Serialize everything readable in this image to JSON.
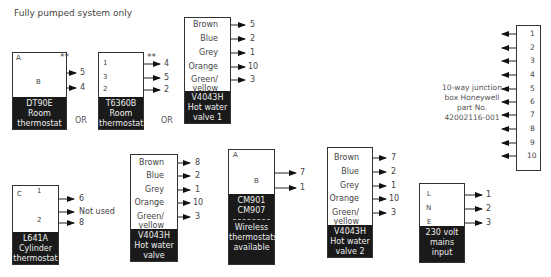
{
  "title": "Fully pumped system only",
  "or_label": "OR",
  "double_star": "**",
  "dt90e": {
    "label": [
      "DT90E",
      "Room",
      "thermostat"
    ],
    "terminals": [
      "A",
      "B"
    ],
    "outputs": [
      "5",
      "4"
    ]
  },
  "t6360b": {
    "label": [
      "T6360B",
      "Room",
      "thermostat"
    ],
    "terminals": [
      "1",
      "3",
      "2"
    ],
    "outputs": [
      "4",
      "5",
      "2"
    ]
  },
  "valve1": {
    "label": [
      "V4043H",
      "Hot water",
      "valve 1"
    ],
    "wires": [
      {
        "color": "Brown",
        "to": "5"
      },
      {
        "color": "Blue",
        "to": "2"
      },
      {
        "color": "Grey",
        "to": "1"
      },
      {
        "color": "Orange",
        "to": "10"
      },
      {
        "color": "Green/",
        "color2": "yellow",
        "to": "3"
      }
    ]
  },
  "junction": {
    "description": [
      "10-way junction",
      "box Honeywell",
      "part No.",
      "42002116-001"
    ],
    "terminals": [
      "1",
      "2",
      "3",
      "4",
      "5",
      "6",
      "7",
      "8",
      "9",
      "10"
    ]
  },
  "l641a": {
    "label": [
      "L641A",
      "Cylinder",
      "thermostat"
    ],
    "terminals": [
      "C",
      "1",
      "2"
    ],
    "outputs": [
      "6",
      "Not used",
      "8"
    ]
  },
  "valve": {
    "label": [
      "V4043H",
      "Hot water",
      "valve"
    ],
    "wires": [
      {
        "color": "Brown",
        "to": "8"
      },
      {
        "color": "Blue",
        "to": "2"
      },
      {
        "color": "Grey",
        "to": "1"
      },
      {
        "color": "Orange",
        "to": "10"
      },
      {
        "color": "Green/",
        "color2": "yellow",
        "to": "3"
      }
    ]
  },
  "cm901": {
    "label": [
      "CM901",
      "CM907"
    ],
    "sub_label": [
      "Wireless",
      "thermostats",
      "available"
    ],
    "terminals": [
      "A",
      "B"
    ],
    "outputs": [
      "7",
      "1"
    ]
  },
  "valve2": {
    "label": [
      "V4043H",
      "Hot water",
      "valve 2"
    ],
    "wires": [
      {
        "color": "Brown",
        "to": "7"
      },
      {
        "color": "Blue",
        "to": "2"
      },
      {
        "color": "Grey",
        "to": "1"
      },
      {
        "color": "Orange",
        "to": "10"
      },
      {
        "color": "Green/",
        "color2": "yellow",
        "to": "3"
      }
    ]
  },
  "mains": {
    "label": [
      "230 volt",
      "mains",
      "input"
    ],
    "terminals": [
      "L",
      "N",
      "E"
    ],
    "outputs": [
      "1",
      "2",
      "3"
    ]
  }
}
